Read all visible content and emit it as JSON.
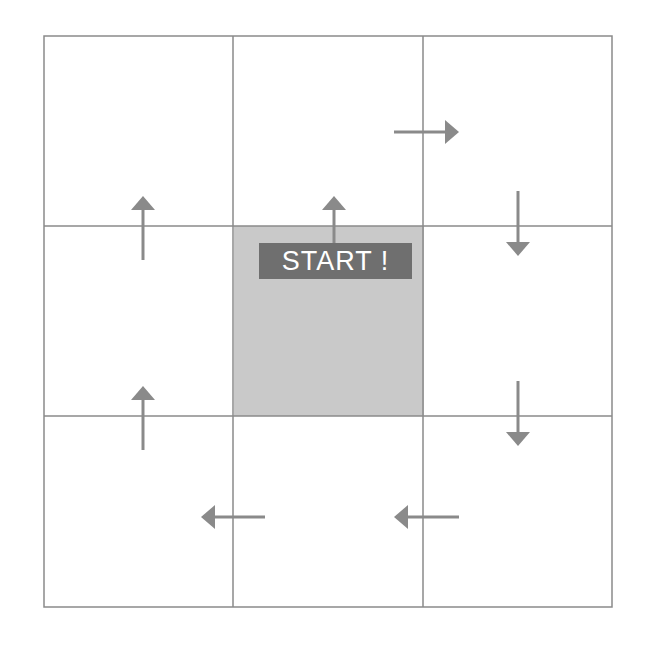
{
  "diagram": {
    "type": "3x3 grid path diagram",
    "start_label": "START !",
    "colors": {
      "grid_line": "#8a8a8a",
      "arrow": "#8a8a8a",
      "start_cell_fill": "#c9c9c9",
      "label_bg": "#6f6f6f",
      "label_text": "#ffffff"
    },
    "grid": {
      "rows": 3,
      "cols": 3,
      "start_cell": [
        1,
        1
      ]
    },
    "arrows": [
      {
        "id": "center-up",
        "direction": "up"
      },
      {
        "id": "top-middle-to-right",
        "direction": "right"
      },
      {
        "id": "right-top-down",
        "direction": "down"
      },
      {
        "id": "right-middle-down",
        "direction": "down"
      },
      {
        "id": "bottom-right-left",
        "direction": "left"
      },
      {
        "id": "bottom-middle-left",
        "direction": "left"
      },
      {
        "id": "left-bottom-up",
        "direction": "up"
      },
      {
        "id": "left-middle-up",
        "direction": "up"
      }
    ]
  }
}
